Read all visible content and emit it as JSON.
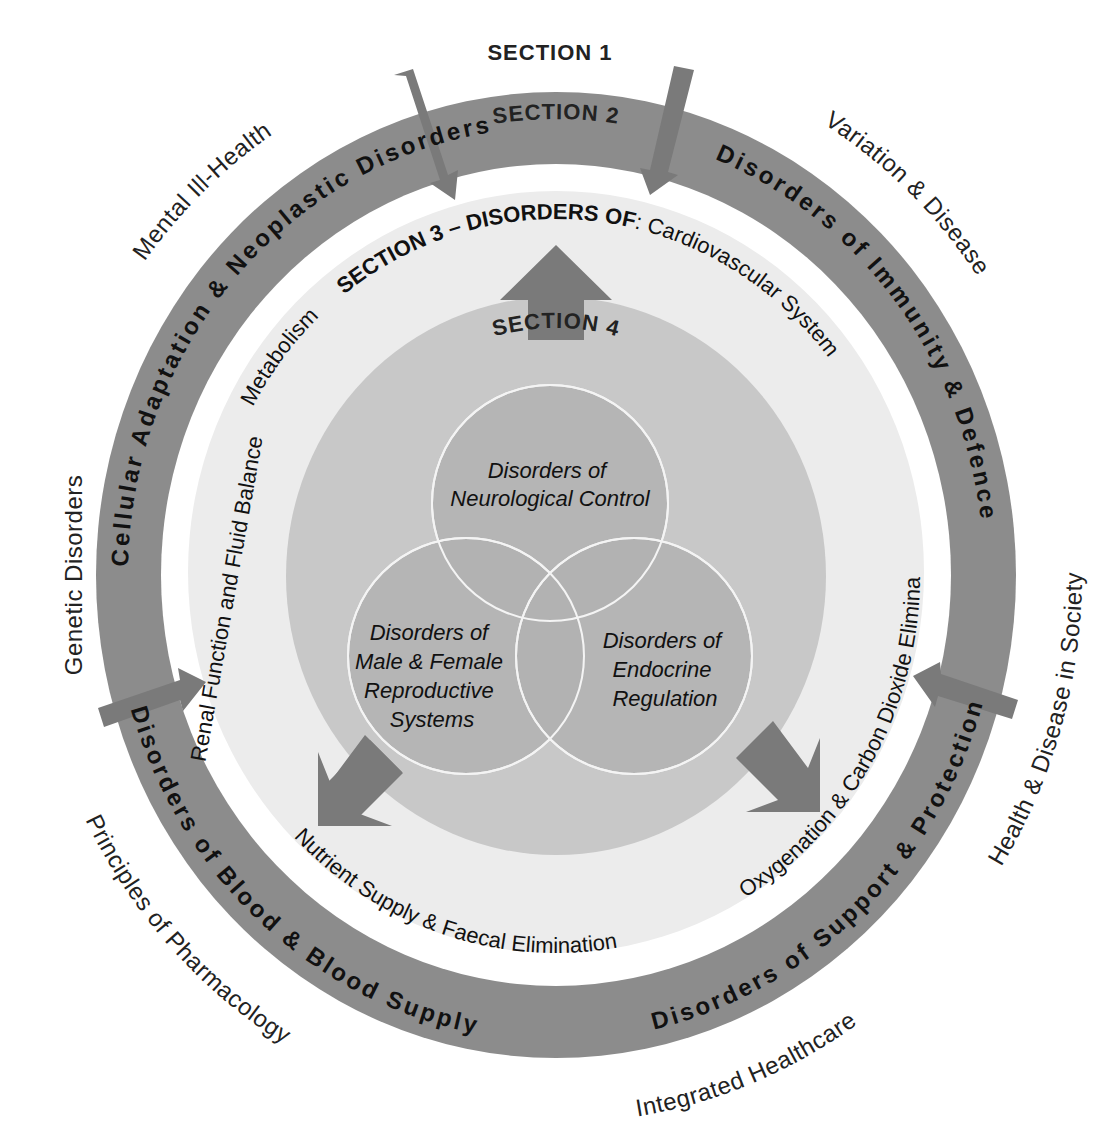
{
  "diagram": {
    "title_top": "SECTION 1",
    "colors": {
      "background": "#ffffff",
      "outer_ring": "#8c8c8c",
      "light_disc": "#ececec",
      "middle_disc": "#c8c8c8",
      "venn_circle": "#b2b2b2",
      "arrow": "#7a7a7a",
      "venn_stroke": "#f4f4f4"
    },
    "section1_topics": {
      "mental": "Mental Ill-Health",
      "variation": "Variation & Disease",
      "genetic": "Genetic Disorders",
      "health_society": "Health & Disease in Society",
      "pharmacology": "Principles of Pharmacology",
      "healthcare": "Integrated Healthcare"
    },
    "section2": {
      "label": "SECTION 2",
      "cellular": "Cellular Adaptation & Neoplastic Disorders",
      "immunity": "Disorders of Immunity & Defence",
      "support": "Disorders of Support & Protection",
      "blood": "Disorders of Blood & Blood Supply"
    },
    "section3": {
      "label_bold": "SECTION 3 – DISORDERS OF",
      "label_rest": ": Cardiovascular System",
      "metabolism": "Metabolism",
      "renal": "Renal Function and Fluid Balance",
      "oxygenation": "Oxygenation & Carbon Dioxide Elimination",
      "nutrient": "Nutrient Supply & Faecal Elimination"
    },
    "section4": {
      "label": "SECTION 4",
      "neuro": [
        "Disorders of",
        "Neurological Control"
      ],
      "repro": [
        "Disorders of",
        "Male & Female",
        "Reproductive",
        "Systems"
      ],
      "endo": [
        "Disorders of",
        "Endocrine",
        "Regulation"
      ]
    }
  }
}
